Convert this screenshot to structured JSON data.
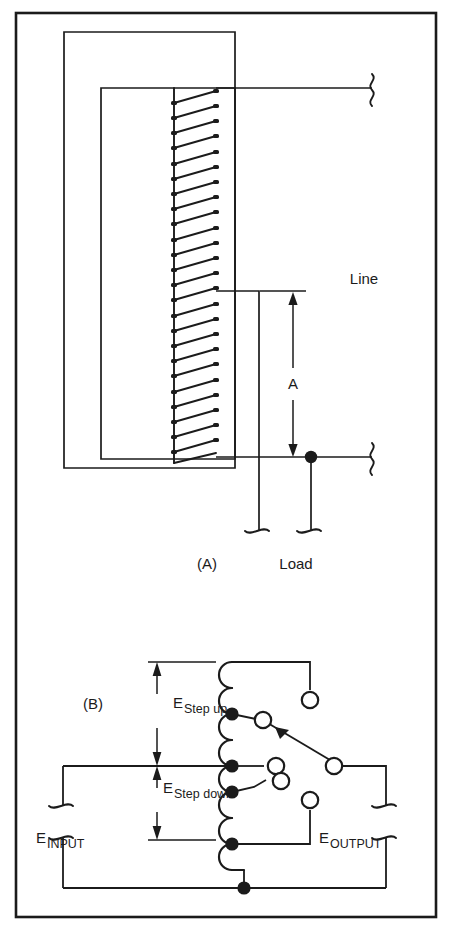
{
  "figure": {
    "title_absent": true,
    "border_color": "#1b1b1b",
    "line_color": "#1b1b1b",
    "background": "#ffffff",
    "width": 452,
    "height": 930
  },
  "panel_a": {
    "id_label": "(A)",
    "line_label": "Line",
    "load_label": "Load",
    "dimension_label": "A",
    "coil_turns": 24,
    "description_absent": true
  },
  "panel_b": {
    "id_label": "(B)",
    "step_up": {
      "symbol": "E",
      "subscript": "Step up"
    },
    "step_down": {
      "symbol": "E",
      "subscript": "Step down"
    },
    "input": {
      "symbol": "E",
      "subscript": "INPUT"
    },
    "output": {
      "symbol": "E",
      "subscript": "OUTPUT"
    },
    "coil_bumps": 8,
    "taps": 4,
    "terminals": 5
  }
}
